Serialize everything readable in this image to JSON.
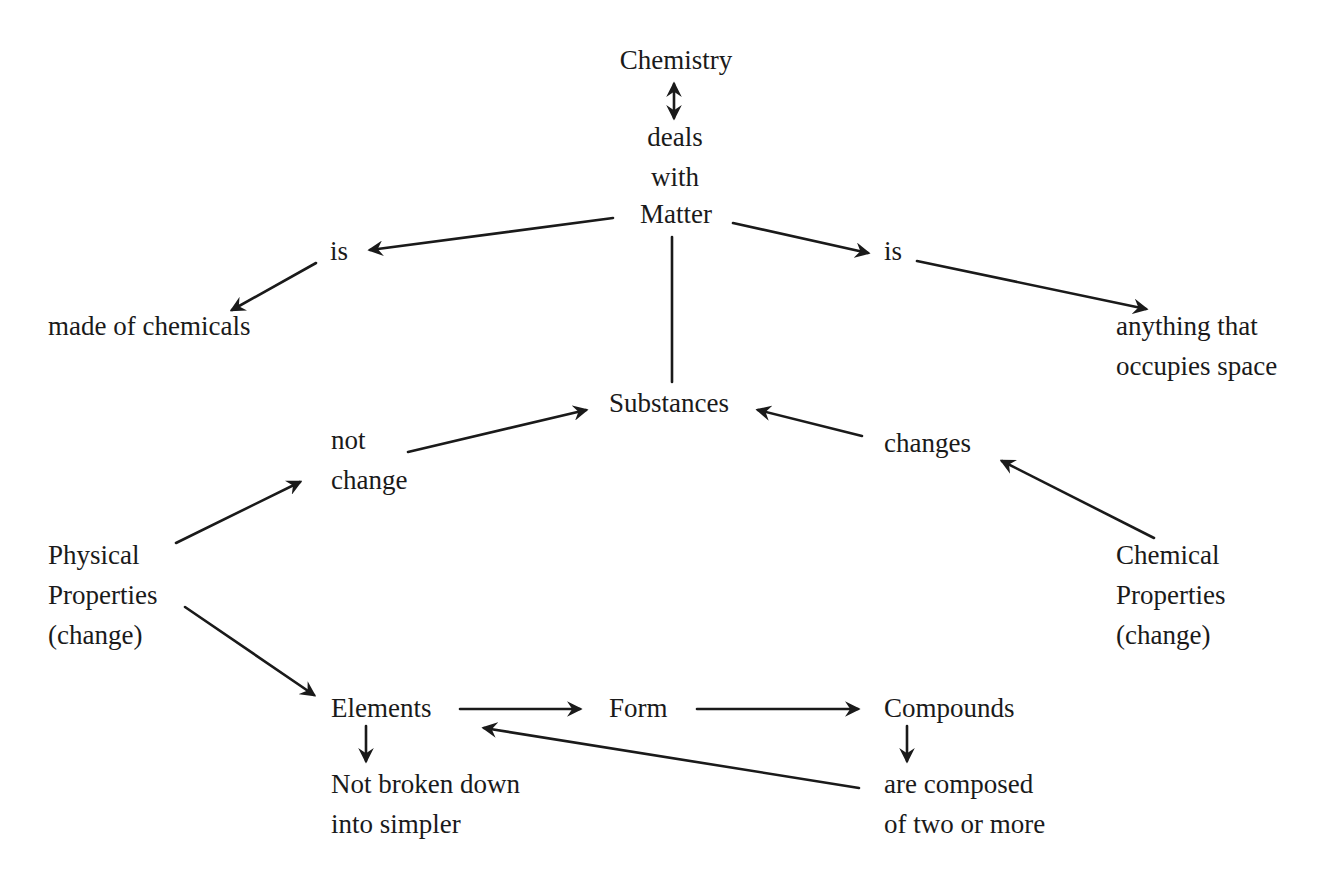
{
  "diagram": {
    "type": "concept-map",
    "nodes": {
      "chemistry": {
        "lines": [
          "Chemistry"
        ]
      },
      "deals_with": {
        "lines": [
          "deals",
          "with"
        ]
      },
      "matter": {
        "lines": [
          "Matter"
        ]
      },
      "is_left": {
        "lines": [
          "is"
        ]
      },
      "made_of_chemicals": {
        "lines": [
          "made of chemicals"
        ]
      },
      "is_right": {
        "lines": [
          "is"
        ]
      },
      "anything_space": {
        "lines": [
          "anything that",
          "occupies space"
        ]
      },
      "substances": {
        "lines": [
          "Substances"
        ]
      },
      "not_change": {
        "lines": [
          "not",
          "change"
        ]
      },
      "changes": {
        "lines": [
          "changes"
        ]
      },
      "physical_properties": {
        "lines": [
          "Physical",
          "Properties",
          "(change)"
        ]
      },
      "chemical_properties": {
        "lines": [
          "Chemical",
          "Properties",
          "(change)"
        ]
      },
      "elements": {
        "lines": [
          "Elements"
        ]
      },
      "form": {
        "lines": [
          "Form"
        ]
      },
      "compounds": {
        "lines": [
          "Compounds"
        ]
      },
      "not_broken_down": {
        "lines": [
          "Not broken down",
          "into simpler"
        ]
      },
      "are_composed": {
        "lines": [
          "are composed",
          "of two or more"
        ]
      }
    },
    "edges": [
      {
        "from": "chemistry",
        "to": "deals_with",
        "style": "double-arrow"
      },
      {
        "from": "matter",
        "to": "is_left",
        "style": "arrow"
      },
      {
        "from": "is_left",
        "to": "made_of_chemicals",
        "style": "arrow"
      },
      {
        "from": "matter",
        "to": "is_right",
        "style": "arrow"
      },
      {
        "from": "is_right",
        "to": "anything_space",
        "style": "arrow"
      },
      {
        "from": "matter",
        "to": "substances",
        "style": "line"
      },
      {
        "from": "not_change",
        "to": "substances",
        "style": "arrow"
      },
      {
        "from": "changes",
        "to": "substances",
        "style": "arrow"
      },
      {
        "from": "physical_properties",
        "to": "not_change",
        "style": "arrow"
      },
      {
        "from": "chemical_properties",
        "to": "changes",
        "style": "arrow"
      },
      {
        "from": "physical_properties",
        "to": "elements",
        "style": "arrow"
      },
      {
        "from": "elements",
        "to": "form",
        "style": "arrow"
      },
      {
        "from": "form",
        "to": "compounds",
        "style": "arrow"
      },
      {
        "from": "elements",
        "to": "not_broken_down",
        "style": "arrow"
      },
      {
        "from": "compounds",
        "to": "are_composed",
        "style": "arrow"
      },
      {
        "from": "are_composed",
        "to": "elements",
        "style": "arrow"
      }
    ],
    "colors": {
      "ink": "#1a1a1a",
      "background": "#ffffff"
    }
  }
}
